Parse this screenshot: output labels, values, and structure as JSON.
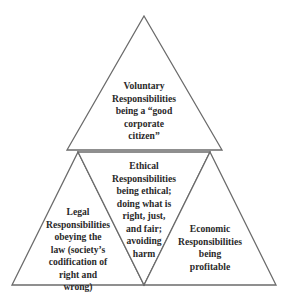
{
  "diagram": {
    "colors": {
      "stroke": "#6b6b6b",
      "fill": "#ffffff",
      "text": "#2a2a2a"
    },
    "triangles": [
      {
        "id": "voluntary",
        "orientation": "up",
        "lines": [
          "Voluntary",
          "Responsibilities",
          "being a “good",
          "corporate",
          "citizen”"
        ]
      },
      {
        "id": "legal",
        "orientation": "up",
        "lines": [
          "Legal",
          "Responsibilities",
          "obeying the",
          "law (society’s",
          "codification of",
          "right and",
          "wrong)"
        ]
      },
      {
        "id": "ethical",
        "orientation": "down",
        "lines": [
          "Ethical",
          "Responsibilities",
          "being ethical;",
          "doing what is",
          "right, just,",
          "and fair;",
          "avoiding",
          "harm"
        ]
      },
      {
        "id": "economic",
        "orientation": "up",
        "lines": [
          "Economic",
          "Responsibilities",
          "being",
          "profitable"
        ]
      }
    ]
  }
}
